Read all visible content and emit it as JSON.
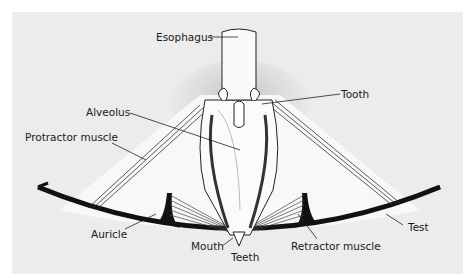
{
  "figure": {
    "labels": {
      "esophagus": "Esophagus",
      "tooth": "Tooth",
      "alveolus": "Alveolus",
      "protractor_muscle": "Protractor muscle",
      "auricle": "Auricle",
      "mouth": "Mouth",
      "teeth": "Teeth",
      "retractor_muscle": "Retractor muscle",
      "test": "Test"
    },
    "colors": {
      "background": "#ffffff",
      "panel": "#ececec",
      "structure_fill": "#f7f7f7",
      "ink": "#111111"
    }
  }
}
